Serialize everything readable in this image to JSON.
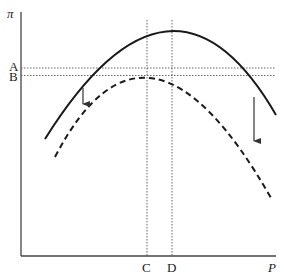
{
  "diagram": {
    "y_axis_label": "π",
    "x_axis_label": "P",
    "y_markers": [
      {
        "label": "A",
        "y": 68
      },
      {
        "label": "B",
        "y": 75
      }
    ],
    "x_markers": [
      {
        "label": "C",
        "x": 147
      },
      {
        "label": "D",
        "x": 172
      }
    ],
    "curves": [
      {
        "name": "original-profit-curve",
        "style": "solid",
        "peak": {
          "x": "D",
          "y": "A"
        }
      },
      {
        "name": "shifted-profit-curve",
        "style": "dashed",
        "peak": {
          "x": "C",
          "y": "B"
        }
      }
    ],
    "arrows": [
      {
        "name": "left-shift-arrow",
        "direction": "down"
      },
      {
        "name": "right-shift-arrow",
        "direction": "down"
      }
    ],
    "colors": {
      "line": "#1a1a1a",
      "guide": "#555555",
      "axis": "#444444"
    }
  }
}
